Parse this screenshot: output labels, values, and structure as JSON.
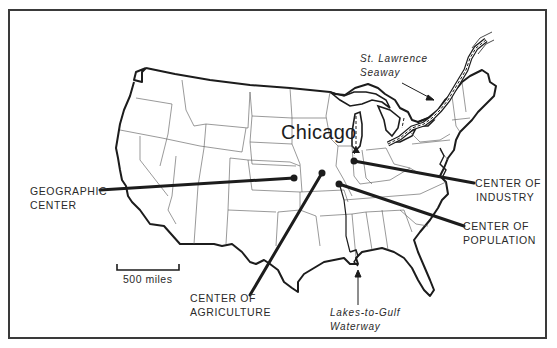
{
  "map": {
    "title_city": "Chicago",
    "scale": {
      "label": "500 miles"
    },
    "labels": {
      "geographic_center": [
        "GEOGRAPHIC",
        "CENTER"
      ],
      "center_of_agriculture": [
        "CENTER OF",
        "AGRICULTURE"
      ],
      "center_of_industry": [
        "CENTER OF",
        "INDUSTRY"
      ],
      "center_of_population": [
        "CENTER OF",
        "POPULATION"
      ],
      "st_lawrence_seaway": [
        "St. Lawrence",
        "Seaway"
      ],
      "lakes_to_gulf_waterway": [
        "Lakes-to-Gulf",
        "Waterway"
      ]
    },
    "points": [
      {
        "name": "Geographic Center",
        "x": 294,
        "y": 178
      },
      {
        "name": "Center of Agriculture",
        "x": 322,
        "y": 173
      },
      {
        "name": "Center of Population",
        "x": 339,
        "y": 184
      },
      {
        "name": "Center of Industry",
        "x": 354,
        "y": 161
      },
      {
        "name": "Chicago",
        "x": 356,
        "y": 150
      }
    ],
    "colors": {
      "ink": "#1c1c1c",
      "background": "#ffffff",
      "frame": "#3a3a3a"
    }
  }
}
